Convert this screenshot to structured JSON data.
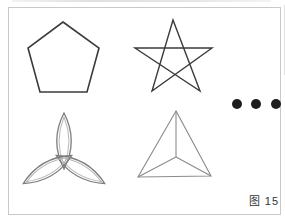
{
  "figure": {
    "caption": {
      "text": "图 15",
      "color": "#333333"
    },
    "frame": {
      "border_color": "#c9c9c9",
      "fill": "#ffffff"
    },
    "shapes": {
      "pentagon": {
        "name": "pentagon",
        "stroke": "#3b3b3b",
        "stroke_width": 1.6,
        "points": [
          [
            63,
            22
          ],
          [
            99,
            48
          ],
          [
            87,
            92
          ],
          [
            40,
            92
          ],
          [
            28,
            48
          ]
        ]
      },
      "star": {
        "name": "five-pointed-star",
        "stroke": "#3b3b3b",
        "stroke_width": 1.4,
        "points": [
          [
            173,
            20
          ],
          [
            152,
            91
          ],
          [
            212,
            48
          ],
          [
            135,
            48
          ],
          [
            200,
            91
          ]
        ]
      },
      "trefoil": {
        "name": "trefoil-three-petals",
        "outer_stroke": "#7d7d7d",
        "outer_stroke_width": 1.3,
        "inner_stroke": "#b6b6b6",
        "inner_stroke_width": 1,
        "center": [
          64,
          160
        ],
        "angles": [
          0,
          120,
          240
        ],
        "outer_petal": {
          "tip": -47,
          "overshoot": 9,
          "half_width": 14.5,
          "waist": -19
        },
        "inner_petal": {
          "tip": -43,
          "overshoot": 5,
          "half_width": 10,
          "waist": -19
        }
      },
      "triangle": {
        "name": "triangle-with-center-lines",
        "stroke": "#8c8c8c",
        "stroke_width": 1.1,
        "vertices": [
          [
            176,
            111
          ],
          [
            138,
            177
          ],
          [
            211,
            176
          ]
        ],
        "center": [
          176,
          157
        ]
      },
      "ellipsis": {
        "name": "continuation-dots",
        "color": "#1e1e1e",
        "radius": 5,
        "centers": [
          [
            237,
            104
          ],
          [
            256,
            104
          ],
          [
            276,
            104
          ]
        ]
      }
    }
  }
}
